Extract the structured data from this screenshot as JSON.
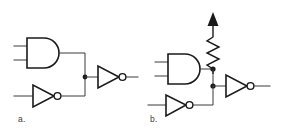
{
  "figure": {
    "background_color": "#ffffff",
    "line_color": "#1a1a1a",
    "wire_color": "#3a3a3a",
    "width": 284,
    "height": 133
  },
  "circuits": [
    {
      "id": "a",
      "caption": "a.",
      "description": "AND gate and inverter outputs tied together driving an inverter, no pull-up",
      "components": [
        {
          "name": "and-gate",
          "type": "and",
          "inputs": 2
        },
        {
          "name": "input-inverter",
          "type": "inverter"
        },
        {
          "name": "output-inverter",
          "type": "inverter"
        },
        {
          "name": "wired-junction",
          "type": "junction"
        }
      ]
    },
    {
      "id": "b",
      "caption": "b.",
      "description": "AND gate and inverter outputs tied together with pull-up resistor to supply driving an inverter",
      "components": [
        {
          "name": "and-gate",
          "type": "and",
          "inputs": 2
        },
        {
          "name": "input-inverter",
          "type": "inverter"
        },
        {
          "name": "output-inverter",
          "type": "inverter"
        },
        {
          "name": "pull-up-resistor",
          "type": "resistor"
        },
        {
          "name": "supply-arrow",
          "type": "supply"
        },
        {
          "name": "upper-junction",
          "type": "junction"
        },
        {
          "name": "lower-junction",
          "type": "junction"
        }
      ]
    }
  ]
}
